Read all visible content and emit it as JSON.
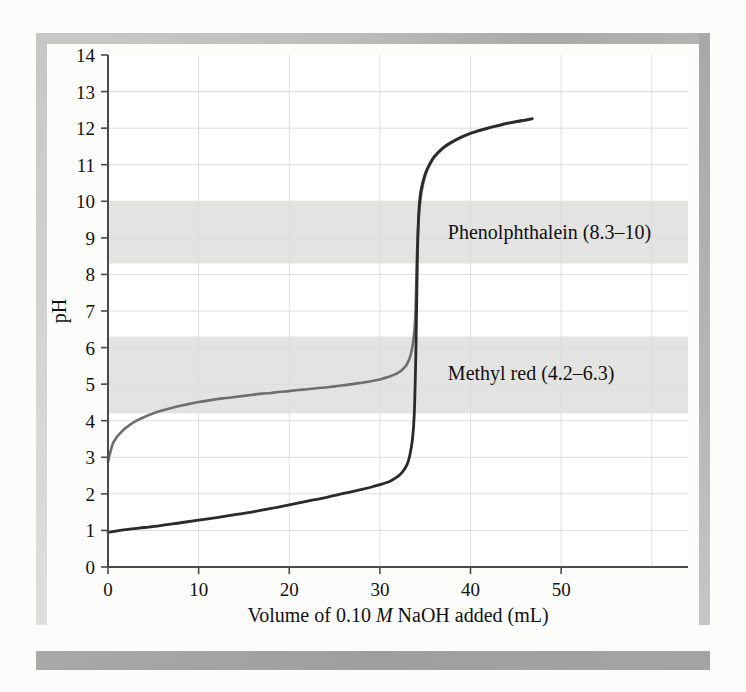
{
  "figure": {
    "background_color": "#fcfcfa",
    "plot_background_color": "#ffffff",
    "frame_color": "#a9a9a9",
    "band_color": "#e3e3e1",
    "gridline_color": "#dddddd",
    "axis_color": "#4a4a4a"
  },
  "chart_data": {
    "type": "line",
    "title": "",
    "xlabel_parts": {
      "pre": "Volume of 0.10 ",
      "italic": "M",
      "post": " NaOH added (mL)"
    },
    "xlabel": "Volume of 0.10 M NaOH added (mL)",
    "ylabel": "pH",
    "xlim": [
      0,
      64
    ],
    "ylim": [
      0,
      14
    ],
    "xticks": [
      0,
      10,
      20,
      30,
      40,
      50
    ],
    "xtick_labels": [
      "0",
      "10",
      "20",
      "30",
      "40",
      "50"
    ],
    "yticks": [
      0,
      1,
      2,
      3,
      4,
      5,
      6,
      7,
      8,
      9,
      10,
      11,
      12,
      13,
      14
    ],
    "ytick_labels": [
      "0",
      "1",
      "2",
      "3",
      "4",
      "5",
      "6",
      "7",
      "8",
      "9",
      "10",
      "11",
      "12",
      "13",
      "14"
    ],
    "grid": true,
    "legend_position": "none",
    "indicator_bands": [
      {
        "name": "Phenolphthalein",
        "label": "Phenolphthalein (8.3–10)",
        "ph_low": 8.3,
        "ph_high": 10,
        "color": "#e3e3e1",
        "label_x_ml": 37.5,
        "label_ph": 9.15
      },
      {
        "name": "Methyl red",
        "label": "Methyl red (4.2–6.3)",
        "ph_low": 4.2,
        "ph_high": 6.3,
        "color": "#e3e3e1",
        "label_x_ml": 37.5,
        "label_ph": 5.3
      }
    ],
    "series": [
      {
        "name": "Weak acid titrated with NaOH",
        "color": "#6e6e6e",
        "width": 2.6,
        "points": [
          [
            0.0,
            2.88
          ],
          [
            0.5,
            3.35
          ],
          [
            1.0,
            3.56
          ],
          [
            1.5,
            3.7
          ],
          [
            2.0,
            3.81
          ],
          [
            3.0,
            3.98
          ],
          [
            4.0,
            4.1
          ],
          [
            5.0,
            4.2
          ],
          [
            6.0,
            4.28
          ],
          [
            7.0,
            4.35
          ],
          [
            8.0,
            4.41
          ],
          [
            9.0,
            4.46
          ],
          [
            10.0,
            4.51
          ],
          [
            11.0,
            4.55
          ],
          [
            12.0,
            4.59
          ],
          [
            13.0,
            4.62
          ],
          [
            14.0,
            4.65
          ],
          [
            15.0,
            4.68
          ],
          [
            16.0,
            4.71
          ],
          [
            17.0,
            4.74
          ],
          [
            18.0,
            4.76
          ],
          [
            19.0,
            4.79
          ],
          [
            20.0,
            4.81
          ],
          [
            21.0,
            4.84
          ],
          [
            22.0,
            4.86
          ],
          [
            23.0,
            4.89
          ],
          [
            24.0,
            4.91
          ],
          [
            25.0,
            4.94
          ],
          [
            26.0,
            4.97
          ],
          [
            27.0,
            5.0
          ],
          [
            28.0,
            5.04
          ],
          [
            29.0,
            5.08
          ],
          [
            30.0,
            5.13
          ],
          [
            31.0,
            5.2
          ],
          [
            31.5,
            5.25
          ],
          [
            32.0,
            5.31
          ],
          [
            32.5,
            5.4
          ],
          [
            33.0,
            5.55
          ],
          [
            33.4,
            5.8
          ],
          [
            33.7,
            6.2
          ],
          [
            33.9,
            6.8
          ],
          [
            34.0,
            7.6
          ],
          [
            34.1,
            8.6
          ],
          [
            34.3,
            9.6
          ],
          [
            34.6,
            10.25
          ],
          [
            35.0,
            10.7
          ],
          [
            35.5,
            11.0
          ],
          [
            36.0,
            11.2
          ],
          [
            37.0,
            11.45
          ],
          [
            38.0,
            11.62
          ],
          [
            39.0,
            11.75
          ],
          [
            40.0,
            11.85
          ],
          [
            41.0,
            11.93
          ],
          [
            42.0,
            12.0
          ],
          [
            43.0,
            12.06
          ],
          [
            44.0,
            12.12
          ],
          [
            45.0,
            12.17
          ],
          [
            46.0,
            12.21
          ],
          [
            46.8,
            12.25
          ]
        ]
      },
      {
        "name": "Strong acid titrated with NaOH",
        "color": "#2a2a2a",
        "width": 2.8,
        "points": [
          [
            0.0,
            0.95
          ],
          [
            2.0,
            1.02
          ],
          [
            4.0,
            1.08
          ],
          [
            6.0,
            1.14
          ],
          [
            8.0,
            1.21
          ],
          [
            10.0,
            1.28
          ],
          [
            12.0,
            1.35
          ],
          [
            14.0,
            1.43
          ],
          [
            16.0,
            1.51
          ],
          [
            18.0,
            1.6
          ],
          [
            20.0,
            1.7
          ],
          [
            22.0,
            1.8
          ],
          [
            24.0,
            1.9
          ],
          [
            26.0,
            2.01
          ],
          [
            28.0,
            2.12
          ],
          [
            29.0,
            2.18
          ],
          [
            30.0,
            2.25
          ],
          [
            31.0,
            2.33
          ],
          [
            31.5,
            2.4
          ],
          [
            32.0,
            2.48
          ],
          [
            32.5,
            2.6
          ],
          [
            33.0,
            2.8
          ],
          [
            33.3,
            3.05
          ],
          [
            33.6,
            3.5
          ],
          [
            33.8,
            4.2
          ],
          [
            33.95,
            5.6
          ],
          [
            34.05,
            7.0
          ],
          [
            34.15,
            8.6
          ],
          [
            34.3,
            9.7
          ],
          [
            34.5,
            10.25
          ],
          [
            35.0,
            10.75
          ],
          [
            35.5,
            11.02
          ],
          [
            36.0,
            11.22
          ],
          [
            37.0,
            11.47
          ],
          [
            38.0,
            11.63
          ],
          [
            39.0,
            11.76
          ],
          [
            40.0,
            11.86
          ],
          [
            41.0,
            11.94
          ],
          [
            42.0,
            12.01
          ],
          [
            43.0,
            12.07
          ],
          [
            44.0,
            12.13
          ],
          [
            45.0,
            12.18
          ],
          [
            46.0,
            12.22
          ],
          [
            46.8,
            12.26
          ]
        ]
      }
    ]
  }
}
